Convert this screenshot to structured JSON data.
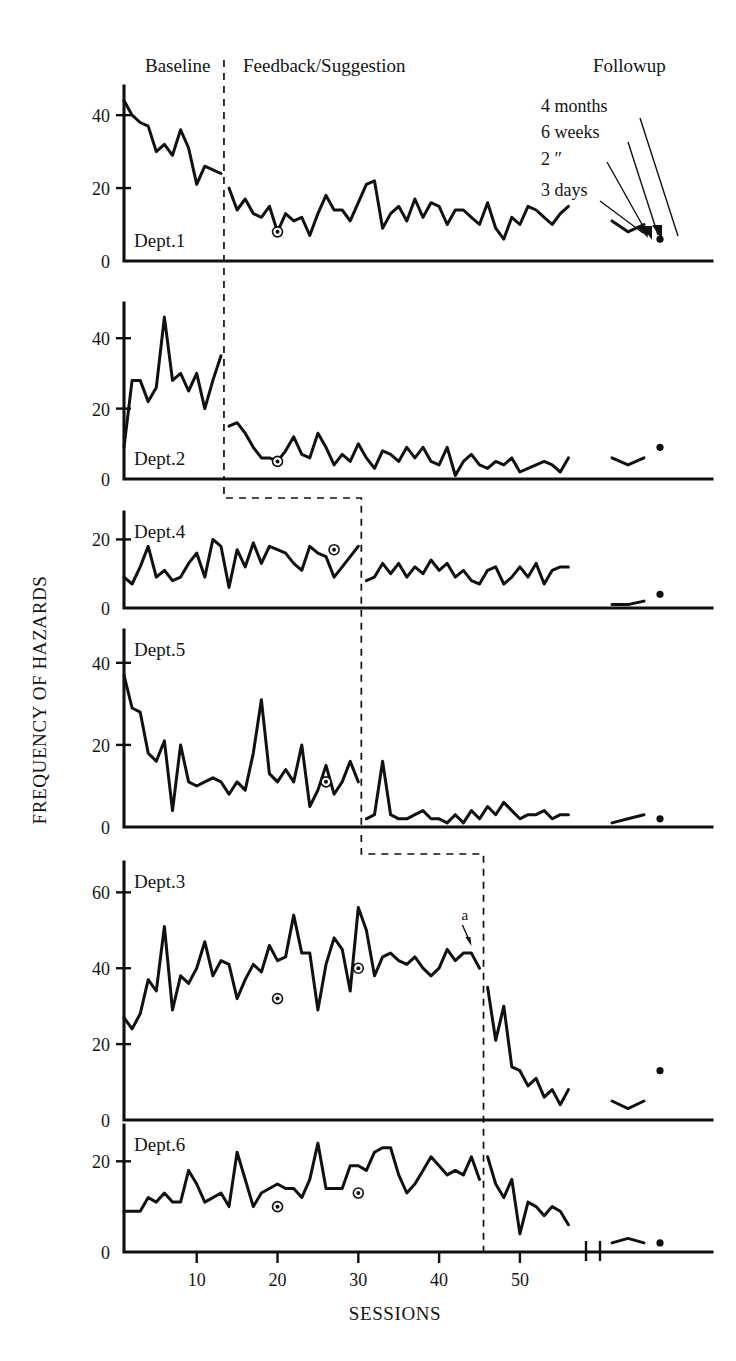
{
  "figure": {
    "y_axis_title": "FREQUENCY OF HAZARDS",
    "x_axis_title": "SESSIONS"
  },
  "phases": {
    "baseline": "Baseline",
    "intervention": "Feedback/Suggestion",
    "followup": "Followup"
  },
  "followup_annotations": [
    {
      "id": "four-months",
      "label": "4 months"
    },
    {
      "id": "six-weeks",
      "label": "6 weeks"
    },
    {
      "id": "two-weeks-ditto",
      "label": "2      ″"
    },
    {
      "id": "three-days",
      "label": "3 days"
    }
  ],
  "point_annotation": {
    "label": "a"
  },
  "x_axis": {
    "ticks": [
      10,
      20,
      30,
      40,
      50
    ],
    "tick_labels": [
      "10",
      "20",
      "30",
      "40",
      "50"
    ],
    "range": [
      1,
      57
    ]
  },
  "chart_data": {
    "type": "line",
    "xlabel": "SESSIONS",
    "ylabel": "FREQUENCY OF HAZARDS",
    "grid": false,
    "legend": "none",
    "design": "multiple-baseline across departments",
    "phase_labels": [
      "Baseline",
      "Feedback/Suggestion",
      "Followup"
    ],
    "panels": [
      {
        "name": "Dept.1",
        "ylim": [
          0,
          48
        ],
        "yticks": [
          0,
          20,
          40
        ],
        "ytick_labels": [
          "0",
          "20",
          "40"
        ],
        "intervention_start_session": 13,
        "baseline": {
          "x": [
            1,
            2,
            3,
            4,
            5,
            6,
            7,
            8,
            9,
            10,
            11,
            12,
            13
          ],
          "y": [
            44,
            40,
            38,
            37,
            30,
            32,
            29,
            36,
            31,
            21,
            26,
            25,
            24
          ]
        },
        "intervention": {
          "x": [
            14,
            15,
            16,
            17,
            18,
            19,
            20,
            21,
            22,
            23,
            24,
            25,
            26,
            27,
            28,
            29,
            30,
            31,
            32,
            33,
            34,
            35,
            36,
            37,
            38,
            39,
            40,
            41,
            42,
            43,
            44,
            45,
            46,
            47,
            48,
            49,
            50,
            51,
            52,
            53,
            54,
            55,
            56
          ],
          "y": [
            20,
            14,
            17,
            13,
            12,
            15,
            8,
            13,
            11,
            12,
            7,
            13,
            18,
            14,
            14,
            11,
            16,
            21,
            22,
            9,
            13,
            15,
            11,
            17,
            12,
            16,
            15,
            10,
            14,
            14,
            12,
            10,
            16,
            9,
            6,
            12,
            10,
            15,
            14,
            12,
            10,
            13,
            15
          ]
        },
        "followup": {
          "x": [
            60,
            62,
            64,
            66
          ],
          "y": [
            11,
            8,
            10,
            6
          ]
        },
        "highlight_points": [
          {
            "x": 20,
            "y": 8
          }
        ]
      },
      {
        "name": "Dept.2",
        "ylim": [
          0,
          50
        ],
        "yticks": [
          0,
          20,
          40
        ],
        "ytick_labels": [
          "0",
          "20",
          "40"
        ],
        "intervention_start_session": 13,
        "baseline": {
          "x": [
            1,
            2,
            3,
            4,
            5,
            6,
            7,
            8,
            9,
            10,
            11,
            12,
            13
          ],
          "y": [
            9,
            28,
            28,
            22,
            26,
            46,
            28,
            30,
            25,
            30,
            20,
            28,
            35
          ]
        },
        "intervention": {
          "x": [
            14,
            15,
            16,
            17,
            18,
            19,
            20,
            21,
            22,
            23,
            24,
            25,
            26,
            27,
            28,
            29,
            30,
            31,
            32,
            33,
            34,
            35,
            36,
            37,
            38,
            39,
            40,
            41,
            42,
            43,
            44,
            45,
            46,
            47,
            48,
            49,
            50,
            51,
            52,
            53,
            54,
            55,
            56
          ],
          "y": [
            15,
            16,
            13,
            9,
            6,
            6,
            5,
            8,
            12,
            7,
            6,
            13,
            9,
            4,
            7,
            5,
            10,
            6,
            3,
            8,
            7,
            5,
            9,
            6,
            9,
            5,
            4,
            9,
            1,
            5,
            7,
            4,
            3,
            5,
            4,
            6,
            2,
            3,
            4,
            5,
            4,
            2,
            6
          ]
        },
        "followup": {
          "x": [
            60,
            62,
            64,
            66
          ],
          "y": [
            6,
            4,
            6,
            9
          ]
        },
        "highlight_points": [
          {
            "x": 20,
            "y": 5
          }
        ]
      },
      {
        "name": "Dept.4",
        "ylim": [
          0,
          28
        ],
        "yticks": [
          0,
          20
        ],
        "ytick_labels": [
          "0",
          "20"
        ],
        "intervention_start_session": 30,
        "baseline": {
          "x": [
            1,
            2,
            3,
            4,
            5,
            6,
            7,
            8,
            9,
            10,
            11,
            12,
            13,
            14,
            15,
            16,
            17,
            18,
            19,
            20,
            21,
            22,
            23,
            24,
            25,
            26,
            27,
            28,
            29,
            30
          ],
          "y": [
            9,
            7,
            12,
            18,
            9,
            11,
            8,
            9,
            13,
            16,
            9,
            20,
            18,
            6,
            17,
            12,
            19,
            13,
            18,
            17,
            16,
            13,
            11,
            18,
            16,
            15,
            9,
            12,
            15,
            18
          ]
        },
        "intervention": {
          "x": [
            31,
            32,
            33,
            34,
            35,
            36,
            37,
            38,
            39,
            40,
            41,
            42,
            43,
            44,
            45,
            46,
            47,
            48,
            49,
            50,
            51,
            52,
            53,
            54,
            55,
            56
          ],
          "y": [
            8,
            9,
            13,
            10,
            13,
            9,
            12,
            10,
            14,
            11,
            13,
            9,
            11,
            8,
            7,
            11,
            12,
            7,
            9,
            12,
            9,
            13,
            7,
            11,
            12,
            12
          ]
        },
        "followup": {
          "x": [
            60,
            62,
            64,
            66
          ],
          "y": [
            1,
            1,
            2,
            4
          ]
        },
        "highlight_points": [
          {
            "x": 27,
            "y": 17
          }
        ]
      },
      {
        "name": "Dept.5",
        "ylim": [
          0,
          48
        ],
        "yticks": [
          0,
          20,
          40
        ],
        "ytick_labels": [
          "0",
          "20",
          "40"
        ],
        "intervention_start_session": 30,
        "baseline": {
          "x": [
            1,
            2,
            3,
            4,
            5,
            6,
            7,
            8,
            9,
            10,
            11,
            12,
            13,
            14,
            15,
            16,
            17,
            18,
            19,
            20,
            21,
            22,
            23,
            24,
            25,
            26,
            27,
            28,
            29,
            30
          ],
          "y": [
            37,
            29,
            28,
            18,
            16,
            21,
            4,
            20,
            11,
            10,
            11,
            12,
            11,
            8,
            11,
            9,
            18,
            31,
            13,
            11,
            14,
            11,
            20,
            5,
            9,
            15,
            8,
            11,
            16,
            11
          ]
        },
        "intervention": {
          "x": [
            31,
            32,
            33,
            34,
            35,
            36,
            37,
            38,
            39,
            40,
            41,
            42,
            43,
            44,
            45,
            46,
            47,
            48,
            49,
            50,
            51,
            52,
            53,
            54,
            55,
            56
          ],
          "y": [
            2,
            3,
            16,
            3,
            2,
            2,
            3,
            4,
            2,
            2,
            1,
            3,
            1,
            4,
            2,
            5,
            3,
            6,
            4,
            2,
            3,
            3,
            4,
            2,
            3,
            3
          ]
        },
        "followup": {
          "x": [
            60,
            62,
            64,
            66
          ],
          "y": [
            1,
            2,
            3,
            2
          ]
        },
        "highlight_points": [
          {
            "x": 26,
            "y": 11
          }
        ]
      },
      {
        "name": "Dept.3",
        "ylim": [
          0,
          68
        ],
        "yticks": [
          0,
          20,
          40,
          60
        ],
        "ytick_labels": [
          "0",
          "20",
          "40",
          "60"
        ],
        "intervention_start_session": 45,
        "baseline": {
          "x": [
            1,
            2,
            3,
            4,
            5,
            6,
            7,
            8,
            9,
            10,
            11,
            12,
            13,
            14,
            15,
            16,
            17,
            18,
            19,
            20,
            21,
            22,
            23,
            24,
            25,
            26,
            27,
            28,
            29,
            30,
            31,
            32,
            33,
            34,
            35,
            36,
            37,
            38,
            39,
            40,
            41,
            42,
            43,
            44,
            45
          ],
          "y": [
            27,
            24,
            28,
            37,
            34,
            51,
            29,
            38,
            36,
            40,
            47,
            38,
            42,
            41,
            32,
            37,
            41,
            39,
            46,
            42,
            43,
            54,
            44,
            44,
            29,
            41,
            48,
            45,
            34,
            56,
            50,
            38,
            43,
            44,
            42,
            41,
            43,
            40,
            38,
            40,
            45,
            42,
            44,
            44,
            40
          ]
        },
        "intervention": {
          "x": [
            46,
            47,
            48,
            49,
            50,
            51,
            52,
            53,
            54,
            55,
            56
          ],
          "y": [
            35,
            21,
            30,
            14,
            13,
            9,
            11,
            6,
            8,
            4,
            8
          ]
        },
        "followup": {
          "x": [
            60,
            62,
            64,
            66
          ],
          "y": [
            5,
            3,
            5,
            13
          ]
        },
        "highlight_points": [
          {
            "x": 20,
            "y": 32
          },
          {
            "x": 30,
            "y": 40
          }
        ],
        "point_label": {
          "label": "a",
          "x": 44,
          "y": 44
        }
      },
      {
        "name": "Dept.6",
        "ylim": [
          0,
          28
        ],
        "yticks": [
          0,
          20
        ],
        "ytick_labels": [
          "0",
          "20"
        ],
        "intervention_start_session": 45,
        "baseline": {
          "x": [
            1,
            2,
            3,
            4,
            5,
            6,
            7,
            8,
            9,
            10,
            11,
            12,
            13,
            14,
            15,
            16,
            17,
            18,
            19,
            20,
            21,
            22,
            23,
            24,
            25,
            26,
            27,
            28,
            29,
            30,
            31,
            32,
            33,
            34,
            35,
            36,
            37,
            38,
            39,
            40,
            41,
            42,
            43,
            44,
            45
          ],
          "y": [
            9,
            9,
            9,
            12,
            11,
            13,
            11,
            11,
            18,
            15,
            11,
            12,
            13,
            10,
            22,
            16,
            10,
            13,
            14,
            15,
            14,
            14,
            12,
            16,
            24,
            14,
            14,
            14,
            19,
            19,
            18,
            22,
            23,
            23,
            17,
            13,
            15,
            18,
            21,
            19,
            17,
            18,
            17,
            21,
            16
          ]
        },
        "intervention": {
          "x": [
            46,
            47,
            48,
            49,
            50,
            51,
            52,
            53,
            54,
            55,
            56
          ],
          "y": [
            21,
            15,
            12,
            16,
            4,
            11,
            10,
            8,
            10,
            9,
            6
          ]
        },
        "followup": {
          "x": [
            60,
            62,
            64,
            66
          ],
          "y": [
            2,
            3,
            2,
            2
          ]
        },
        "highlight_points": [
          {
            "x": 20,
            "y": 10
          },
          {
            "x": 30,
            "y": 13
          }
        ]
      }
    ]
  }
}
